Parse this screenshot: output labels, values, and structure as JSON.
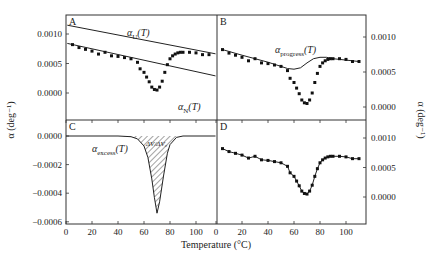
{
  "chart_data": {
    "type": "scatter",
    "figure": "Four-panel thermal expansion coefficient figure",
    "xlabel": "Temperature (°C)",
    "ylabel_left": "α (deg⁻¹)",
    "ylabel_right": "α (deg⁻¹)",
    "x_ticks": [
      0,
      20,
      40,
      60,
      80,
      100
    ],
    "xlim": [
      0,
      115
    ],
    "panels": [
      {
        "id": "A",
        "label": "A",
        "y_ticks": [
          "0.0010",
          "0.0005",
          "0.0000"
        ],
        "ylim": [
          -0.0006,
          0.00125
        ],
        "series": [
          {
            "name": "data",
            "kind": "points"
          },
          {
            "name": "αU(T)",
            "kind": "line",
            "x": [
              5,
              110
            ],
            "values": [
              0.00113,
              0.00068
            ]
          },
          {
            "name": "αN(T)",
            "kind": "line",
            "x": [
              5,
              110
            ],
            "values": [
              0.00082,
              0.00032
            ]
          }
        ],
        "annotations": [
          "αU(T)",
          "αN(T)"
        ]
      },
      {
        "id": "B",
        "label": "B",
        "y_ticks": [
          "0.0010",
          "0.0005",
          "0.0000"
        ],
        "ylim": [
          -0.0004,
          0.0013
        ],
        "series": [
          {
            "name": "data",
            "kind": "points"
          },
          {
            "name": "αprogress(T)",
            "kind": "line",
            "x": [
              5,
              20,
              40,
              55,
              60,
              65,
              70,
              75,
              80,
              85,
              90,
              100,
              110
            ],
            "values": [
              0.00082,
              0.00074,
              0.00064,
              0.00055,
              0.00054,
              0.00056,
              0.00063,
              0.00069,
              0.00071,
              0.00071,
              0.00069,
              0.00067,
              0.00065
            ]
          }
        ],
        "annotations": [
          "αprogress(T)"
        ]
      },
      {
        "id": "C",
        "label": "C",
        "y_ticks": [
          "0.0000",
          "-0.0002",
          "-0.0004",
          "-0.0006"
        ],
        "ylim": [
          -0.0006,
          0.00012
        ],
        "series": [
          {
            "name": "αexcess(T)",
            "kind": "line",
            "x": [
              0,
              40,
              50,
              55,
              60,
              63,
              66,
              68,
              70,
              72,
              75,
              78,
              80,
              85,
              90,
              100,
              115
            ],
            "values": [
              0,
              0,
              -5e-06,
              -2e-05,
              -7e-05,
              -0.00015,
              -0.0003,
              -0.00043,
              -0.00054,
              -0.00046,
              -0.00028,
              -0.00012,
              -6e-05,
              -1e-05,
              0,
              0,
              0
            ]
          }
        ],
        "annotations": [
          "αexcess(T)",
          "ΔV/ΔV₀"
        ],
        "shaded_region": "area between αexcess(T) and zero (hatched)"
      },
      {
        "id": "D",
        "label": "D",
        "y_ticks": [
          "0.0010",
          "0.0005",
          "0.0000"
        ],
        "ylim": [
          -0.0004,
          0.0013
        ],
        "series": [
          {
            "name": "data",
            "kind": "points"
          },
          {
            "name": "fit",
            "kind": "line"
          }
        ]
      }
    ],
    "data_points": {
      "x": [
        5,
        10,
        15,
        20,
        25,
        30,
        35,
        40,
        45,
        50,
        55,
        57,
        60,
        62,
        64,
        66,
        68,
        70,
        72,
        74,
        76,
        78,
        80,
        82,
        84,
        86,
        88,
        90,
        95,
        100,
        105,
        110
      ],
      "values": [
        0.00082,
        0.00077,
        0.00074,
        0.00071,
        0.00066,
        0.00069,
        0.00063,
        0.00062,
        0.0006,
        0.00058,
        0.00052,
        0.00041,
        0.00035,
        0.00027,
        0.00019,
        0.0001,
        6e-05,
        5e-05,
        0.0001,
        0.0002,
        0.00035,
        0.00048,
        0.00058,
        0.00063,
        0.00066,
        0.00068,
        0.00069,
        0.00069,
        0.00069,
        0.00068,
        0.00065,
        0.00065
      ]
    },
    "grid": false,
    "legend": "none (inline annotations)"
  },
  "labels": {
    "panel_a": "A",
    "panel_b": "B",
    "panel_c": "C",
    "panel_d": "D",
    "alpha_u": "α",
    "alpha_u_sub": "U",
    "alpha_u_arg": "(T)",
    "alpha_n": "α",
    "alpha_n_sub": "N",
    "alpha_n_arg": "(T)",
    "alpha_progress": "α",
    "alpha_progress_sub": "progress",
    "alpha_progress_arg": "(T)",
    "alpha_excess": "α",
    "alpha_excess_sub": "excess",
    "alpha_excess_arg": "(T)",
    "hatch_label": "ΔV/ΔV₀",
    "xlabel": "Temperature (°C)",
    "ylabel_left": "α (deg⁻¹)",
    "ylabel_right": "α (deg⁻¹)"
  }
}
